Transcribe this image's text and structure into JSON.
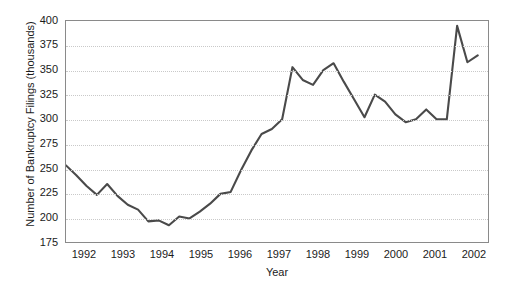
{
  "chart_data": {
    "type": "line",
    "title": "",
    "xlabel": "Year",
    "ylabel": "Number of Bankruptcy Filings (thousands)",
    "xlim": [
      1991.75,
      2002.0
    ],
    "ylim": [
      175,
      400
    ],
    "ytick_labels": [
      "400",
      "375",
      "350",
      "325",
      "300",
      "275",
      "250",
      "225",
      "200",
      "175"
    ],
    "ytick_values": [
      400,
      375,
      350,
      325,
      300,
      275,
      250,
      225,
      200,
      175
    ],
    "xtick_labels": [
      "1992",
      "1993",
      "1994",
      "1995",
      "1996",
      "1997",
      "1998",
      "1999",
      "2000",
      "2001",
      "2002"
    ],
    "xtick_values": [
      1992,
      1993,
      1994,
      1995,
      1996,
      1997,
      1998,
      1999,
      2000,
      2001,
      2002
    ],
    "grid": "horizontal-dotted",
    "legend": "none",
    "series": [
      {
        "name": "Bankruptcy Filings",
        "color": "#4a4a4a",
        "x": [
          1991.75,
          1992.0,
          1992.25,
          1992.5,
          1992.75,
          1993.0,
          1993.25,
          1993.5,
          1993.75,
          1994.0,
          1994.25,
          1994.5,
          1994.75,
          1995.0,
          1995.25,
          1995.5,
          1995.75,
          1996.0,
          1996.25,
          1996.5,
          1996.75,
          1997.0,
          1997.25,
          1997.5,
          1997.75,
          1998.0,
          1998.25,
          1998.5,
          1998.75,
          1999.0,
          1999.25,
          1999.5,
          1999.75,
          2000.0,
          2000.25,
          2000.5,
          2000.75,
          2001.0,
          2001.25,
          2001.5,
          2001.75
        ],
        "values": [
          253,
          243,
          232,
          223,
          234,
          222,
          213,
          208,
          196,
          197,
          192,
          201,
          199,
          206,
          214,
          224,
          226,
          248,
          268,
          285,
          290,
          300,
          353,
          340,
          335,
          350,
          357,
          338,
          320,
          302,
          325,
          318,
          305,
          297,
          300,
          310,
          300,
          300,
          395,
          358,
          365
        ],
        "values_note": "quarterly, thousands"
      }
    ]
  },
  "axes": {
    "y_title": "Number of Bankruptcy Filings (thousands)",
    "x_title": "Year"
  }
}
